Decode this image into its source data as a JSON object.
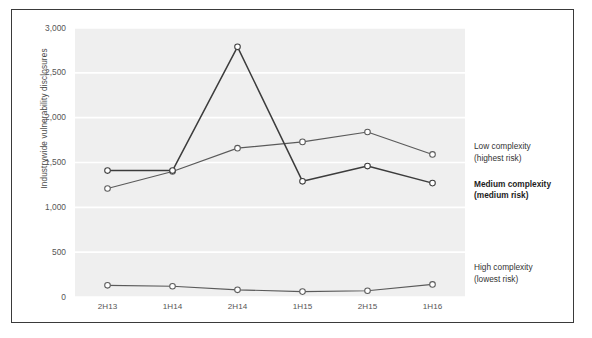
{
  "chart_data": {
    "type": "line",
    "title": "",
    "xlabel": "",
    "ylabel": "Industrywide vulnerability disclosures",
    "categories": [
      "2H13",
      "1H14",
      "2H14",
      "1H15",
      "2H15",
      "1H16"
    ],
    "ylim": [
      0,
      3000
    ],
    "yticks": [
      "0",
      "500",
      "1,000",
      "1,500",
      "2,000",
      "2,500",
      "3,000"
    ],
    "ytick_values": [
      0,
      500,
      1000,
      1500,
      2000,
      2500,
      3000
    ],
    "grid": "horizontal-white-on-gray",
    "legend_position": "right",
    "series": [
      {
        "name": "Low complexity (highest risk)",
        "label_line1": "Low complexity",
        "label_line2": "(highest risk)",
        "emphasis": "normal",
        "color": "#5a5a5a",
        "values": [
          1210,
          1400,
          1660,
          1730,
          1840,
          1590
        ]
      },
      {
        "name": "Medium complexity (medium risk)",
        "label_line1": "Medium complexity",
        "label_line2": "(medium risk)",
        "emphasis": "bold",
        "color": "#3c3c3c",
        "values": [
          1410,
          1410,
          2790,
          1290,
          1460,
          1270
        ]
      },
      {
        "name": "High complexity (lowest risk)",
        "label_line1": "High complexity",
        "label_line2": "(lowest risk)",
        "emphasis": "normal",
        "color": "#5a5a5a",
        "values": [
          130,
          120,
          80,
          60,
          70,
          140
        ]
      }
    ]
  },
  "figure": {
    "border_color": "#3a3a3a",
    "plot_background": "#efefef",
    "gridline_color": "#ffffff",
    "marker_fill": "#ffffff"
  }
}
